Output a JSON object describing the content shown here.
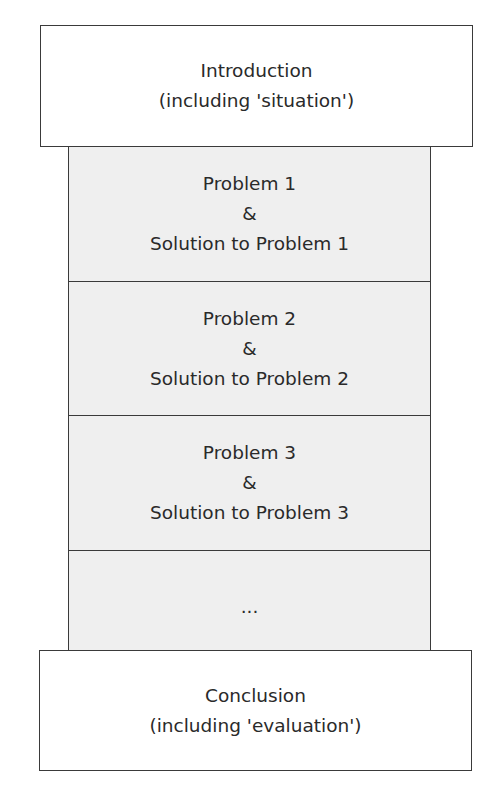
{
  "diagram": {
    "intro": {
      "title": "Introduction",
      "subtitle": "(including 'situation')"
    },
    "sections": [
      {
        "problem": "Problem 1",
        "connector": "&",
        "solution": "Solution to Problem 1"
      },
      {
        "problem": "Problem 2",
        "connector": "&",
        "solution": "Solution to Problem 2"
      },
      {
        "problem": "Problem 3",
        "connector": "&",
        "solution": "Solution to Problem 3"
      }
    ],
    "continuation": "...",
    "conclusion": {
      "title": "Conclusion",
      "subtitle": "(including 'evaluation')"
    },
    "colors": {
      "border": "#3a3a3a",
      "middle_fill": "#efefef",
      "box_fill": "#ffffff",
      "text": "#2a2a2a"
    }
  }
}
